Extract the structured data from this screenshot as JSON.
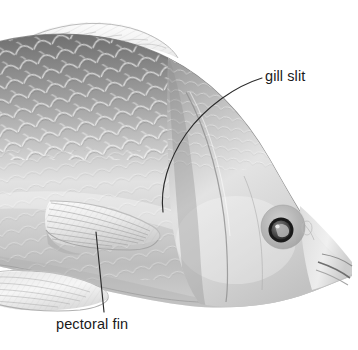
{
  "figure": {
    "background_color": "#ffffff",
    "width": 358,
    "height": 350,
    "style": "grayscale pencil/airbrush scientific illustration",
    "orientation": "fish facing right, anterior body and head shown, tail cropped at left edge"
  },
  "labels": [
    {
      "id": "gill-slit",
      "text": "gill slit",
      "color": "#1a1a1a",
      "x": 265,
      "y": 68,
      "leader": {
        "type": "curve",
        "from": [
          262,
          78
        ],
        "to": [
          163,
          212
        ],
        "color": "#2b2b2b"
      }
    },
    {
      "id": "pectoral-fin",
      "text": "pectoral fin",
      "color": "#1a1a1a",
      "x": 56,
      "y": 316,
      "leader": {
        "type": "line",
        "from": [
          104,
          312
        ],
        "to": [
          96,
          232
        ],
        "color": "#2b2b2b"
      }
    }
  ],
  "anatomy": {
    "body": {
      "name": "body",
      "fill_light": "#f2f2f2",
      "fill_mid": "#b9b9b9",
      "fill_dark": "#8c8c8c"
    },
    "dorsal_fin": {
      "name": "dorsal-fin",
      "fill": "#f4f4f4"
    },
    "pelvic_fin": {
      "name": "pelvic-fin",
      "fill": "#f1f1f1"
    },
    "pectoral_fin": {
      "name": "pectoral-fin",
      "fill": "#f6f6f6"
    },
    "eye": {
      "name": "eye",
      "ring_color": "#171717",
      "iris_color": "#6a6a6a",
      "socket_color": "#a9a9a9",
      "cx": 283,
      "cy": 227,
      "r": 13
    },
    "mouth": {
      "name": "mouth",
      "color": "#4a4a4a"
    },
    "gill_cover": {
      "name": "gill-cover-operculum",
      "edge_color": "#9a9a9a"
    },
    "scales": {
      "name": "scales",
      "highlight": "#ffffff",
      "shadow": "#7e7e7e"
    }
  }
}
